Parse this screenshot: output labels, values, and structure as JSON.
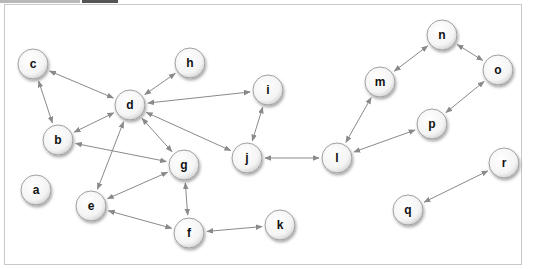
{
  "tabs": [
    {
      "label": "",
      "color": "#b8b8b8",
      "x": 0,
      "w": 80
    },
    {
      "label": "",
      "color": "#555555",
      "x": 82,
      "w": 36
    }
  ],
  "graph": {
    "nodes": [
      {
        "id": "a",
        "label": "a",
        "x": 36,
        "y": 190
      },
      {
        "id": "b",
        "label": "b",
        "x": 58,
        "y": 140
      },
      {
        "id": "c",
        "label": "c",
        "x": 33,
        "y": 64
      },
      {
        "id": "d",
        "label": "d",
        "x": 130,
        "y": 105
      },
      {
        "id": "e",
        "label": "e",
        "x": 91,
        "y": 206
      },
      {
        "id": "f",
        "label": "f",
        "x": 189,
        "y": 233
      },
      {
        "id": "g",
        "label": "g",
        "x": 184,
        "y": 165
      },
      {
        "id": "h",
        "label": "h",
        "x": 190,
        "y": 63
      },
      {
        "id": "i",
        "label": "i",
        "x": 268,
        "y": 90
      },
      {
        "id": "j",
        "label": "j",
        "x": 247,
        "y": 158
      },
      {
        "id": "k",
        "label": "k",
        "x": 280,
        "y": 225
      },
      {
        "id": "l",
        "label": "l",
        "x": 337,
        "y": 158
      },
      {
        "id": "m",
        "label": "m",
        "x": 380,
        "y": 82
      },
      {
        "id": "n",
        "label": "n",
        "x": 442,
        "y": 35
      },
      {
        "id": "o",
        "label": "o",
        "x": 498,
        "y": 70
      },
      {
        "id": "p",
        "label": "p",
        "x": 432,
        "y": 124
      },
      {
        "id": "q",
        "label": "q",
        "x": 408,
        "y": 210
      },
      {
        "id": "r",
        "label": "r",
        "x": 504,
        "y": 163
      }
    ],
    "edges": [
      [
        "c",
        "d"
      ],
      [
        "c",
        "b"
      ],
      [
        "d",
        "b"
      ],
      [
        "d",
        "h"
      ],
      [
        "d",
        "i"
      ],
      [
        "d",
        "j"
      ],
      [
        "d",
        "g"
      ],
      [
        "d",
        "e"
      ],
      [
        "b",
        "g"
      ],
      [
        "g",
        "e"
      ],
      [
        "g",
        "f"
      ],
      [
        "e",
        "f"
      ],
      [
        "f",
        "k"
      ],
      [
        "i",
        "j"
      ],
      [
        "j",
        "l"
      ],
      [
        "l",
        "m"
      ],
      [
        "l",
        "p"
      ],
      [
        "m",
        "n"
      ],
      [
        "n",
        "o"
      ],
      [
        "o",
        "p"
      ],
      [
        "q",
        "r"
      ]
    ],
    "style": {
      "node_radius": 15,
      "edge_color": "#8a8a8a",
      "node_fill": "#ffffff",
      "node_stroke": "#a0a0a0"
    }
  }
}
